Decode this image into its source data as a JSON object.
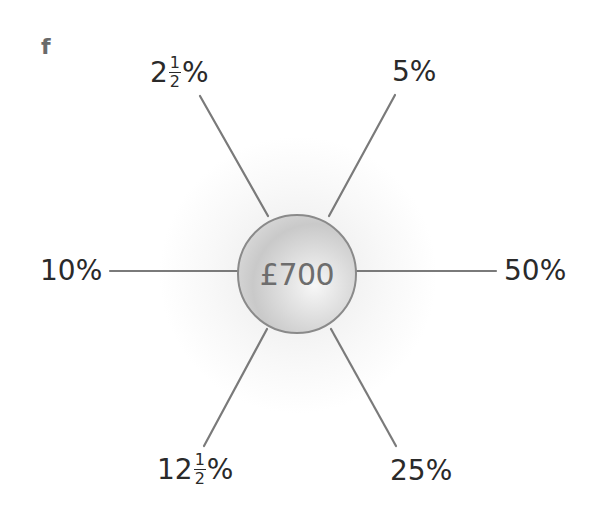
{
  "panel_label": "f",
  "center": {
    "label": "£700",
    "value": 700,
    "currency": "£"
  },
  "spokes": [
    {
      "id": "top-left",
      "whole": "2",
      "num": "1",
      "den": "2",
      "suffix": "%",
      "percent": 2.5
    },
    {
      "id": "top-right",
      "text": "5%",
      "percent": 5
    },
    {
      "id": "left",
      "text": "10%",
      "percent": 10
    },
    {
      "id": "right",
      "text": "50%",
      "percent": 50
    },
    {
      "id": "bottom-left",
      "whole": "12",
      "num": "1",
      "den": "2",
      "suffix": "%",
      "percent": 12.5
    },
    {
      "id": "bottom-right",
      "text": "25%",
      "percent": 25
    }
  ],
  "colors": {
    "line": "#7a7a7a",
    "circle_border": "#8a8a8a",
    "text": "#2a2a2a",
    "center_text": "#6d6d6d"
  }
}
